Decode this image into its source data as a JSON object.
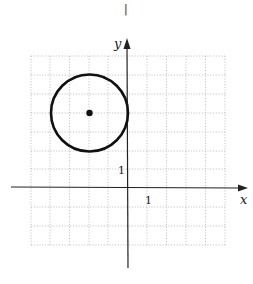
{
  "figure": {
    "top_mark": "|",
    "axis_labels": {
      "x": "x",
      "y": "y"
    },
    "tick_labels": {
      "x_one": "1",
      "y_one": "1"
    },
    "grid": {
      "x_min": -5,
      "x_max": 5,
      "y_min": -3,
      "y_max": 7,
      "step": 1,
      "style": "dotted"
    },
    "circle": {
      "center": [
        -2,
        4
      ],
      "radius": 2,
      "show_center_point": true
    },
    "colors": {
      "ink": "#111111",
      "grid": "#b8b8b8",
      "background": "#ffffff"
    }
  }
}
